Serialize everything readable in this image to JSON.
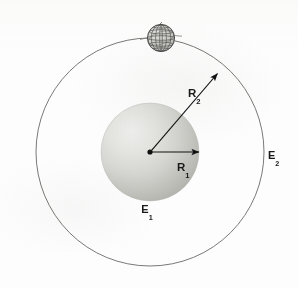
{
  "figure": {
    "background_color": "#fdfdfd",
    "line_color": "#555555",
    "label_color": "#1a1a1a",
    "labels": {
      "inner_radius": {
        "base": "R",
        "subscript": "1",
        "full": "R₁"
      },
      "outer_radius": {
        "base": "R",
        "subscript": "2",
        "full": "R₂"
      },
      "inner_surface": {
        "base": "E",
        "subscript": "1",
        "full": "E₁"
      },
      "outer_surface": {
        "base": "E",
        "subscript": "2",
        "full": "E₂"
      }
    },
    "geometry": {
      "center": {
        "x": 150,
        "y": 152
      },
      "inner_sphere_radius": 49,
      "outer_circle_radius": 114,
      "globe": {
        "x": 161,
        "y": 38,
        "radius": 14
      }
    },
    "colors": {
      "sphere_light": "#e9e9e7",
      "sphere_mid": "#cfcfcc",
      "sphere_dark": "#b6b6b2",
      "globe_fill": "#cdcdc9",
      "outline": "#555555",
      "arrow": "#111111"
    },
    "elements": {
      "inner_sphere_name": "inner conducting sphere",
      "outer_circle_name": "outer spherical shell",
      "globe_name": "wireframe globe",
      "center_dot_name": "common center point",
      "inner_arrow_name": "inner radius arrow",
      "outer_arrow_name": "outer radius arrow"
    }
  }
}
